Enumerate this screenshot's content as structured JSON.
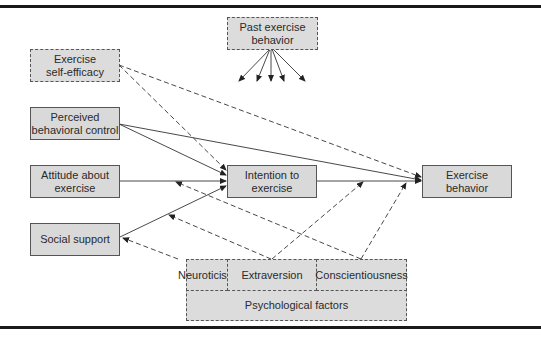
{
  "diagram": {
    "type": "path-model",
    "nodes": {
      "past_exercise": {
        "label_line1": "Past exercise",
        "label_line2": "behavior",
        "style": "dashed"
      },
      "self_efficacy": {
        "label_line1": "Exercise",
        "label_line2": "self-efficacy",
        "style": "dashed"
      },
      "perceived_control": {
        "label_line1": "Perceived",
        "label_line2": "behavioral control",
        "style": "solid"
      },
      "attitude": {
        "label_line1": "Attitude about",
        "label_line2": "exercise",
        "style": "solid"
      },
      "social_support": {
        "label": "Social support",
        "style": "solid"
      },
      "intention": {
        "label_line1": "Intention to",
        "label_line2": "exercise",
        "style": "solid"
      },
      "exercise_behavior": {
        "label_line1": "Exercise",
        "label_line2": "behavior",
        "style": "solid"
      },
      "neuroticism": {
        "label": "Neuroticism",
        "style": "dashed"
      },
      "extraversion": {
        "label": "Extraversion",
        "style": "dashed"
      },
      "conscientiousness": {
        "label": "Conscientiousness",
        "style": "dashed"
      },
      "psych_factors": {
        "label": "Psychological factors",
        "style": "dashed"
      }
    },
    "edges": [
      {
        "from": "past_exercise",
        "to": "(multiple, fan of 5 arrows)",
        "style": "solid"
      },
      {
        "from": "self_efficacy",
        "to": "intention",
        "style": "dashed"
      },
      {
        "from": "self_efficacy",
        "to": "exercise_behavior",
        "style": "dashed"
      },
      {
        "from": "perceived_control",
        "to": "intention",
        "style": "solid"
      },
      {
        "from": "perceived_control",
        "to": "exercise_behavior",
        "style": "solid"
      },
      {
        "from": "attitude",
        "to": "intention",
        "style": "solid"
      },
      {
        "from": "social_support",
        "to": "intention",
        "style": "solid"
      },
      {
        "from": "intention",
        "to": "exercise_behavior",
        "style": "solid"
      },
      {
        "from": "neuroticism",
        "to": "social_support",
        "style": "dashed"
      },
      {
        "from": "extraversion",
        "to": "social_support/intention path",
        "style": "dashed"
      },
      {
        "from": "extraversion",
        "to": "intention-behavior path",
        "style": "dashed"
      },
      {
        "from": "conscientiousness",
        "to": "attitude-intention path",
        "style": "dashed"
      },
      {
        "from": "conscientiousness",
        "to": "intention-behavior path",
        "style": "dashed"
      }
    ]
  }
}
